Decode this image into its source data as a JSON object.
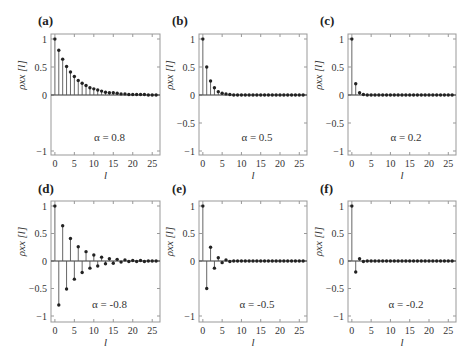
{
  "chart_data": [
    {
      "panel": "(a)",
      "type": "stem",
      "annotation": "α = 0.8",
      "alpha": 0.8,
      "xlabel": "l",
      "ylabel": "ρxx [l]",
      "xlim": [
        -1,
        27
      ],
      "ylim": [
        -1.1,
        1.1
      ],
      "xticks": [
        0,
        5,
        10,
        15,
        20,
        25
      ],
      "yticks": [
        -1,
        0,
        0.5,
        1
      ],
      "ytick_labels": [
        "−1",
        "0",
        "0.5",
        "1"
      ],
      "x": [
        0,
        1,
        2,
        3,
        4,
        5,
        6,
        7,
        8,
        9,
        10,
        11,
        12,
        13,
        14,
        15,
        16,
        17,
        18,
        19,
        20,
        21,
        22,
        23,
        24,
        25,
        26
      ],
      "values": [
        1.0,
        0.8,
        0.64,
        0.51,
        0.41,
        0.33,
        0.26,
        0.21,
        0.17,
        0.13,
        0.11,
        0.09,
        0.07,
        0.05,
        0.04,
        0.04,
        0.03,
        0.02,
        0.02,
        0.01,
        0.01,
        0.01,
        0.01,
        0.01,
        0.0,
        0.0,
        0.0
      ]
    },
    {
      "panel": "(b)",
      "type": "stem",
      "annotation": "α = 0.5",
      "alpha": 0.5,
      "xlabel": "l",
      "ylabel": "ρxx [l]",
      "xlim": [
        -1,
        27
      ],
      "ylim": [
        -1.1,
        1.1
      ],
      "xticks": [
        0,
        5,
        10,
        15,
        20,
        25
      ],
      "yticks": [
        -1,
        -0.5,
        0,
        0.5,
        1
      ],
      "ytick_labels": [
        "−1",
        "−0.5",
        "0",
        "0.5",
        "1"
      ],
      "x": [
        0,
        1,
        2,
        3,
        4,
        5,
        6,
        7,
        8,
        9,
        10,
        11,
        12,
        13,
        14,
        15,
        16,
        17,
        18,
        19,
        20,
        21,
        22,
        23,
        24,
        25,
        26
      ],
      "values": [
        1.0,
        0.5,
        0.25,
        0.13,
        0.06,
        0.03,
        0.02,
        0.01,
        0.0,
        0.0,
        0.0,
        0.0,
        0.0,
        0.0,
        0.0,
        0.0,
        0.0,
        0.0,
        0.0,
        0.0,
        0.0,
        0.0,
        0.0,
        0.0,
        0.0,
        0.0,
        0.0
      ]
    },
    {
      "panel": "(c)",
      "type": "stem",
      "annotation": "α = 0.2",
      "alpha": 0.2,
      "xlabel": "l",
      "ylabel": "ρxx [l]",
      "xlim": [
        -1,
        27
      ],
      "ylim": [
        -1.1,
        1.1
      ],
      "xticks": [
        0,
        5,
        10,
        15,
        20,
        25
      ],
      "yticks": [
        -1,
        -0.5,
        0,
        0.5,
        1
      ],
      "ytick_labels": [
        "−1",
        "−0.5",
        "0",
        "0.5",
        "1"
      ],
      "x": [
        0,
        1,
        2,
        3,
        4,
        5,
        6,
        7,
        8,
        9,
        10,
        11,
        12,
        13,
        14,
        15,
        16,
        17,
        18,
        19,
        20,
        21,
        22,
        23,
        24,
        25,
        26
      ],
      "values": [
        1.0,
        0.2,
        0.04,
        0.01,
        0.0,
        0.0,
        0.0,
        0.0,
        0.0,
        0.0,
        0.0,
        0.0,
        0.0,
        0.0,
        0.0,
        0.0,
        0.0,
        0.0,
        0.0,
        0.0,
        0.0,
        0.0,
        0.0,
        0.0,
        0.0,
        0.0,
        0.0
      ]
    },
    {
      "panel": "(d)",
      "type": "stem",
      "annotation": "α = -0.8",
      "alpha": -0.8,
      "xlabel": "l",
      "ylabel": "ρxx [l]",
      "xlim": [
        -1,
        27
      ],
      "ylim": [
        -1.1,
        1.1
      ],
      "xticks": [
        0,
        5,
        10,
        15,
        20,
        25
      ],
      "yticks": [
        -1,
        -0.5,
        0,
        0.5,
        1
      ],
      "ytick_labels": [
        "−1",
        "−0.5",
        "0",
        "0.5",
        "1"
      ],
      "x": [
        0,
        1,
        2,
        3,
        4,
        5,
        6,
        7,
        8,
        9,
        10,
        11,
        12,
        13,
        14,
        15,
        16,
        17,
        18,
        19,
        20,
        21,
        22,
        23,
        24,
        25,
        26
      ],
      "values": [
        1.0,
        -0.8,
        0.64,
        -0.51,
        0.41,
        -0.33,
        0.26,
        -0.21,
        0.17,
        -0.13,
        0.11,
        -0.09,
        0.07,
        -0.05,
        0.04,
        -0.04,
        0.03,
        -0.02,
        0.02,
        -0.01,
        0.01,
        -0.01,
        0.01,
        -0.01,
        0.0,
        0.0,
        0.0
      ]
    },
    {
      "panel": "(e)",
      "type": "stem",
      "annotation": "α = -0.5",
      "alpha": -0.5,
      "xlabel": "l",
      "ylabel": "ρxx [l]",
      "xlim": [
        -1,
        27
      ],
      "ylim": [
        -1.1,
        1.1
      ],
      "xticks": [
        0,
        5,
        10,
        15,
        20,
        25
      ],
      "yticks": [
        -1,
        0,
        0.5,
        1
      ],
      "ytick_labels": [
        "−1",
        "0",
        "0.5",
        "1"
      ],
      "x": [
        0,
        1,
        2,
        3,
        4,
        5,
        6,
        7,
        8,
        9,
        10,
        11,
        12,
        13,
        14,
        15,
        16,
        17,
        18,
        19,
        20,
        21,
        22,
        23,
        24,
        25,
        26
      ],
      "values": [
        1.0,
        -0.5,
        0.25,
        -0.13,
        0.06,
        -0.03,
        0.02,
        -0.01,
        0.0,
        0.0,
        0.0,
        0.0,
        0.0,
        0.0,
        0.0,
        0.0,
        0.0,
        0.0,
        0.0,
        0.0,
        0.0,
        0.0,
        0.0,
        0.0,
        0.0,
        0.0,
        0.0
      ]
    },
    {
      "panel": "(f)",
      "type": "stem",
      "annotation": "α = -0.2",
      "alpha": -0.2,
      "xlabel": "l",
      "ylabel": "ρxx [l]",
      "xlim": [
        -1,
        27
      ],
      "ylim": [
        -1.1,
        1.1
      ],
      "xticks": [
        0,
        5,
        10,
        15,
        20,
        25
      ],
      "yticks": [
        -1,
        -0.5,
        0,
        0.5,
        1
      ],
      "ytick_labels": [
        "−1",
        "−0.5",
        "0",
        "0.5",
        "1"
      ],
      "x": [
        0,
        1,
        2,
        3,
        4,
        5,
        6,
        7,
        8,
        9,
        10,
        11,
        12,
        13,
        14,
        15,
        16,
        17,
        18,
        19,
        20,
        21,
        22,
        23,
        24,
        25,
        26
      ],
      "values": [
        1.0,
        -0.2,
        0.04,
        -0.01,
        0.0,
        0.0,
        0.0,
        0.0,
        0.0,
        0.0,
        0.0,
        0.0,
        0.0,
        0.0,
        0.0,
        0.0,
        0.0,
        0.0,
        0.0,
        0.0,
        0.0,
        0.0,
        0.0,
        0.0,
        0.0,
        0.0,
        0.0
      ]
    }
  ],
  "layout": {
    "panels": [
      {
        "left": 51,
        "right": 160,
        "y1": 39,
        "y0": 95,
        "ym1": 150,
        "top": 34,
        "bottom": 155,
        "label_x": 38,
        "label_y": 25
      },
      {
        "left": 199,
        "right": 307,
        "y1": 39,
        "y0": 95,
        "ym1": 150,
        "top": 34,
        "bottom": 155,
        "label_x": 172,
        "label_y": 25
      },
      {
        "left": 348,
        "right": 456,
        "y1": 39,
        "y0": 95,
        "ym1": 150,
        "top": 34,
        "bottom": 155,
        "label_x": 320,
        "label_y": 25
      },
      {
        "left": 51,
        "right": 160,
        "y1": 206,
        "y0": 261,
        "ym1": 317,
        "top": 201,
        "bottom": 322,
        "label_x": 38,
        "label_y": 193
      },
      {
        "left": 199,
        "right": 307,
        "y1": 206,
        "y0": 261,
        "ym1": 317,
        "top": 201,
        "bottom": 322,
        "label_x": 172,
        "label_y": 193
      },
      {
        "left": 348,
        "right": 456,
        "y1": 206,
        "y0": 261,
        "ym1": 317,
        "top": 201,
        "bottom": 322,
        "label_x": 320,
        "label_y": 193
      }
    ],
    "stem_color": "#555555",
    "marker_color": "#222222",
    "frame_color": "#999999"
  }
}
